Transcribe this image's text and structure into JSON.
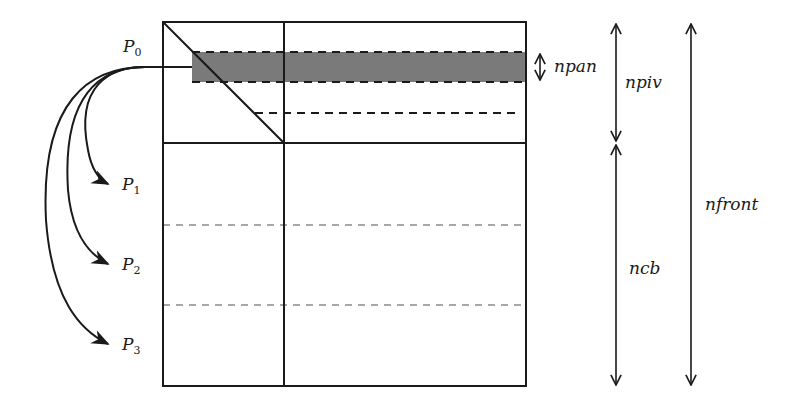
{
  "diagram": {
    "processes": [
      {
        "name": "P",
        "index": "0"
      },
      {
        "name": "P",
        "index": "1"
      },
      {
        "name": "P",
        "index": "2"
      },
      {
        "name": "P",
        "index": "3"
      }
    ],
    "dimensions": {
      "npan": "npan",
      "npiv": "npiv",
      "ncb": "ncb",
      "nfront": "nfront"
    },
    "colors": {
      "line": "#1a1a1a",
      "panel_fill": "#7a7a7a",
      "gray_dash": "#8a8a8a"
    }
  }
}
